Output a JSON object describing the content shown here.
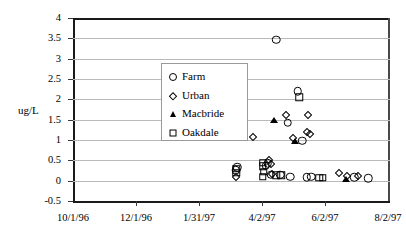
{
  "chart_data": {
    "type": "scatter",
    "title": "",
    "xlabel": "",
    "ylabel": "ug/L",
    "ylim": [
      -0.5,
      4
    ],
    "ytick_labels": [
      "4",
      "3.5",
      "3",
      "2.5",
      "2",
      "1.5",
      "1",
      "0.5",
      "0",
      "-0.5"
    ],
    "ytick_values": [
      4,
      3.5,
      3,
      2.5,
      2,
      1.5,
      1,
      0.5,
      0,
      -0.5
    ],
    "xtick_labels": [
      "10/1/96",
      "12/1/96",
      "1/31/97",
      "4/2/97",
      "6/2/97",
      "8/2/97"
    ],
    "grid": "horizontal",
    "legend_position": "upper-left-inside",
    "legend_entries": [
      {
        "label": "Farm",
        "marker": "circle"
      },
      {
        "label": "Urban",
        "marker": "diamond"
      },
      {
        "label": "Macbride",
        "marker": "triangle"
      },
      {
        "label": "Oakdale",
        "marker": "square"
      }
    ],
    "series": [
      {
        "name": "Farm",
        "marker": "circle",
        "points": [
          {
            "xf": 0.646,
            "y": 3.47
          },
          {
            "xf": 0.713,
            "y": 2.2
          },
          {
            "xf": 0.682,
            "y": 1.42
          },
          {
            "xf": 0.727,
            "y": 0.98
          },
          {
            "xf": 0.521,
            "y": 0.33
          },
          {
            "xf": 0.516,
            "y": 0.26
          },
          {
            "xf": 0.618,
            "y": 0.43
          },
          {
            "xf": 0.612,
            "y": 0.37
          },
          {
            "xf": 0.627,
            "y": 0.14
          },
          {
            "xf": 0.658,
            "y": 0.14
          },
          {
            "xf": 0.69,
            "y": 0.1
          },
          {
            "xf": 0.742,
            "y": 0.09
          },
          {
            "xf": 0.757,
            "y": 0.1
          },
          {
            "xf": 0.893,
            "y": 0.09
          },
          {
            "xf": 0.938,
            "y": 0.06
          }
        ]
      },
      {
        "name": "Urban",
        "marker": "diamond",
        "points": [
          {
            "xf": 0.676,
            "y": 1.62
          },
          {
            "xf": 0.745,
            "y": 1.62
          },
          {
            "xf": 0.57,
            "y": 1.07
          },
          {
            "xf": 0.697,
            "y": 1.06
          },
          {
            "xf": 0.742,
            "y": 1.2
          },
          {
            "xf": 0.752,
            "y": 1.14
          },
          {
            "xf": 0.517,
            "y": 0.09
          },
          {
            "xf": 0.623,
            "y": 0.5
          },
          {
            "xf": 0.628,
            "y": 0.42
          },
          {
            "xf": 0.632,
            "y": 0.16
          },
          {
            "xf": 0.846,
            "y": 0.2
          },
          {
            "xf": 0.871,
            "y": 0.11
          },
          {
            "xf": 0.904,
            "y": 0.12
          }
        ]
      },
      {
        "name": "Macbride",
        "marker": "triangle",
        "points": [
          {
            "xf": 0.637,
            "y": 1.5
          },
          {
            "xf": 0.706,
            "y": 0.98
          },
          {
            "xf": 0.866,
            "y": 0.03
          }
        ]
      },
      {
        "name": "Oakdale",
        "marker": "square",
        "points": [
          {
            "xf": 0.718,
            "y": 2.05
          },
          {
            "xf": 0.518,
            "y": 0.29
          },
          {
            "xf": 0.518,
            "y": 0.19
          },
          {
            "xf": 0.603,
            "y": 0.44
          },
          {
            "xf": 0.603,
            "y": 0.36
          },
          {
            "xf": 0.605,
            "y": 0.22
          },
          {
            "xf": 0.603,
            "y": 0.1
          },
          {
            "xf": 0.661,
            "y": 0.13
          },
          {
            "xf": 0.645,
            "y": 0.13
          },
          {
            "xf": 0.782,
            "y": 0.07
          },
          {
            "xf": 0.793,
            "y": 0.07
          }
        ]
      }
    ]
  }
}
